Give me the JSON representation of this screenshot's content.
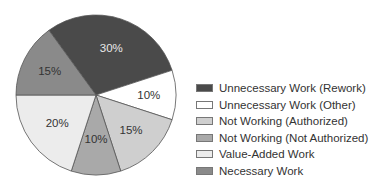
{
  "chart_data": {
    "type": "pie",
    "title": "",
    "categories": [
      "Unnecessary Work (Rework)",
      "Unnecessary Work (Other)",
      "Not Working (Authorized)",
      "Not Working (Not Authorized)",
      "Value-Added Work",
      "Necessary Work"
    ],
    "values": [
      30,
      10,
      15,
      10,
      20,
      15
    ],
    "labels": [
      "30%",
      "10%",
      "15%",
      "10%",
      "20%",
      "15%"
    ],
    "colors": [
      "#4a4a4a",
      "#ffffff",
      "#cfcfcf",
      "#a9a9a9",
      "#ececec",
      "#8a8a8a"
    ],
    "label_colors": [
      "#e8e8e8",
      "#333333",
      "#333333",
      "#333333",
      "#333333",
      "#333333"
    ],
    "start_angle_deg": -126,
    "direction": "clockwise",
    "legend_position": "right"
  },
  "legend": {
    "items": [
      {
        "label": "Unnecessary Work (Rework)",
        "color": "#4a4a4a"
      },
      {
        "label": "Unnecessary Work (Other)",
        "color": "#ffffff"
      },
      {
        "label": "Not Working (Authorized)",
        "color": "#cfcfcf"
      },
      {
        "label": "Not Working (Not Authorized)",
        "color": "#a9a9a9"
      },
      {
        "label": "Value-Added Work",
        "color": "#ececec"
      },
      {
        "label": "Necessary Work",
        "color": "#8a8a8a"
      }
    ]
  }
}
